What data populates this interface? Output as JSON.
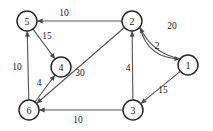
{
  "figure": {
    "kind": "directed-weighted-graph",
    "background_color": "#ffffff",
    "node_stroke_color": "#2b2b2b",
    "edge_color": "#595959",
    "label_color": "#1a1a1a"
  },
  "chart_data": {
    "type": "diagram",
    "title": "",
    "xlabel": "",
    "ylabel": "",
    "directed": true,
    "weighted": true,
    "node_ids": [
      "1",
      "2",
      "3",
      "4",
      "5",
      "6"
    ],
    "nodes": [
      {
        "id": "1",
        "label": "1",
        "x": 188,
        "y": 65,
        "r": 10
      },
      {
        "id": "2",
        "label": "2",
        "x": 132,
        "y": 21,
        "r": 10
      },
      {
        "id": "3",
        "label": "3",
        "x": 133,
        "y": 110,
        "r": 10
      },
      {
        "id": "4",
        "label": "4",
        "x": 61,
        "y": 67,
        "r": 10
      },
      {
        "id": "5",
        "label": "5",
        "x": 27,
        "y": 21,
        "r": 10
      },
      {
        "id": "6",
        "label": "6",
        "x": 29,
        "y": 110,
        "r": 10
      }
    ],
    "edges": [
      {
        "from": "2",
        "to": "5",
        "weight": 10,
        "weight_label": "10",
        "label_x": 64,
        "label_y": 13,
        "shape": "straight"
      },
      {
        "from": "5",
        "to": "4",
        "weight": 15,
        "weight_label": "15",
        "label_x": 47,
        "label_y": 36,
        "shape": "straight"
      },
      {
        "from": "6",
        "to": "5",
        "weight": 10,
        "weight_label": "10",
        "label_x": 17,
        "label_y": 67,
        "shape": "straight"
      },
      {
        "from": "6",
        "to": "4",
        "weight": 4,
        "weight_label": "4",
        "label_x": 39,
        "label_y": 83,
        "shape": "straight"
      },
      {
        "from": "2",
        "to": "6",
        "weight": 30,
        "weight_label": "30",
        "label_x": 80,
        "label_y": 73,
        "shape": "straight"
      },
      {
        "from": "2",
        "to": "1",
        "weight": 20,
        "weight_label": "20",
        "label_x": 172,
        "label_y": 26,
        "shape": "curve-outer"
      },
      {
        "from": "1",
        "to": "2",
        "weight": 2,
        "weight_label": "2",
        "label_x": 157,
        "label_y": 46,
        "shape": "curve-inner"
      },
      {
        "from": "1",
        "to": "3",
        "weight": 15,
        "weight_label": "15",
        "label_x": 163,
        "label_y": 90,
        "shape": "straight"
      },
      {
        "from": "3",
        "to": "2",
        "weight": 4,
        "weight_label": "4",
        "label_x": 128,
        "label_y": 68,
        "shape": "straight"
      },
      {
        "from": "3",
        "to": "6",
        "weight": 10,
        "weight_label": "10",
        "label_x": 78,
        "label_y": 120,
        "shape": "straight"
      }
    ]
  }
}
